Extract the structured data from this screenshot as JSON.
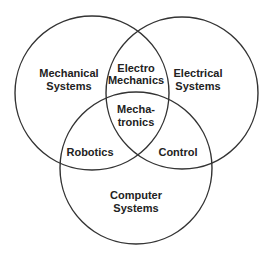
{
  "diagram": {
    "type": "venn",
    "stroke_color": "#333333",
    "circles": [
      {
        "id": "mechanical",
        "lines": [
          "Mechanical",
          "Systems"
        ]
      },
      {
        "id": "electrical",
        "lines": [
          "Electrical",
          "Systems"
        ]
      },
      {
        "id": "computer",
        "lines": [
          "Computer",
          "Systems"
        ]
      }
    ],
    "intersections": {
      "mechanical_electrical": [
        "Electro",
        "Mechanics"
      ],
      "mechanical_computer": [
        "Robotics"
      ],
      "electrical_computer": [
        "Control"
      ],
      "all_three": [
        "Mecha-",
        "tronics"
      ]
    }
  }
}
